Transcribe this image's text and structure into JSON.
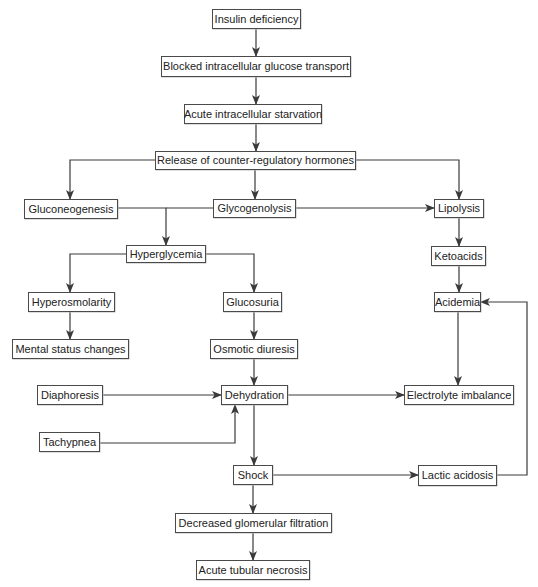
{
  "diagram": {
    "type": "flowchart",
    "colors": {
      "line": "#3a3a3a",
      "box_border": "#4a4a4a",
      "text": "#222222",
      "background": "#ffffff"
    },
    "nodes": [
      {
        "id": "insulin_deficiency",
        "label": "Insulin deficiency",
        "x": 212,
        "y": 9,
        "w": 89,
        "h": 20
      },
      {
        "id": "blocked_transport",
        "label": "Blocked intracellular glucose transport",
        "x": 161,
        "y": 56,
        "w": 190,
        "h": 21
      },
      {
        "id": "acute_starvation",
        "label": "Acute intracellular starvation",
        "x": 184,
        "y": 104,
        "w": 138,
        "h": 20
      },
      {
        "id": "counter_regulatory",
        "label": "Release of counter-regulatory hormones",
        "x": 155,
        "y": 151,
        "w": 201,
        "h": 19
      },
      {
        "id": "gluconeogenesis",
        "label": "Gluconeogenesis",
        "x": 24,
        "y": 199,
        "w": 94,
        "h": 20
      },
      {
        "id": "glycogenolysis",
        "label": "Glycogenolysis",
        "x": 213,
        "y": 199,
        "w": 83,
        "h": 19
      },
      {
        "id": "lipolysis",
        "label": "Lipolysis",
        "x": 434,
        "y": 199,
        "w": 50,
        "h": 19
      },
      {
        "id": "hyperglycemia",
        "label": "Hyperglycemia",
        "x": 126,
        "y": 245,
        "w": 80,
        "h": 18
      },
      {
        "id": "ketoacids",
        "label": "Ketoacids",
        "x": 431,
        "y": 246,
        "w": 55,
        "h": 20
      },
      {
        "id": "hyperosmolarity",
        "label": "Hyperosmolarity",
        "x": 28,
        "y": 292,
        "w": 87,
        "h": 20
      },
      {
        "id": "glucosuria",
        "label": "Glucosuria",
        "x": 223,
        "y": 292,
        "w": 59,
        "h": 20
      },
      {
        "id": "acidemia",
        "label": "Acidemia",
        "x": 434,
        "y": 292,
        "w": 47,
        "h": 20
      },
      {
        "id": "mental_status",
        "label": "Mental status changes",
        "x": 12,
        "y": 339,
        "w": 117,
        "h": 20
      },
      {
        "id": "osmotic_diuresis",
        "label": "Osmotic diuresis",
        "x": 210,
        "y": 339,
        "w": 88,
        "h": 20
      },
      {
        "id": "diaphoresis",
        "label": "Diaphoresis",
        "x": 37,
        "y": 385,
        "w": 66,
        "h": 20
      },
      {
        "id": "dehydration",
        "label": "Dehydration",
        "x": 221,
        "y": 385,
        "w": 67,
        "h": 20
      },
      {
        "id": "electrolyte_imbalance",
        "label": "Electrolyte imbalance",
        "x": 404,
        "y": 385,
        "w": 110,
        "h": 20
      },
      {
        "id": "tachypnea",
        "label": "Tachypnea",
        "x": 39,
        "y": 432,
        "w": 61,
        "h": 20
      },
      {
        "id": "shock",
        "label": "Shock",
        "x": 233,
        "y": 465,
        "w": 40,
        "h": 20
      },
      {
        "id": "lactic_acidosis",
        "label": "Lactic acidosis",
        "x": 418,
        "y": 465,
        "w": 79,
        "h": 21
      },
      {
        "id": "decreased_gfr",
        "label": "Decreased glomerular filtration",
        "x": 175,
        "y": 513,
        "w": 157,
        "h": 20
      },
      {
        "id": "acute_tubular_necrosis",
        "label": "Acute tubular necrosis",
        "x": 196,
        "y": 560,
        "w": 114,
        "h": 20
      }
    ],
    "edges": [
      {
        "from": "insulin_deficiency",
        "to": "blocked_transport",
        "points": [
          [
            256,
            29
          ],
          [
            256,
            56
          ]
        ]
      },
      {
        "from": "blocked_transport",
        "to": "acute_starvation",
        "points": [
          [
            256,
            77
          ],
          [
            256,
            104
          ]
        ]
      },
      {
        "from": "acute_starvation",
        "to": "counter_regulatory",
        "points": [
          [
            256,
            124
          ],
          [
            256,
            151
          ]
        ]
      },
      {
        "from": "counter_regulatory",
        "to": "gluconeogenesis",
        "points": [
          [
            155,
            160
          ],
          [
            70,
            160
          ],
          [
            70,
            199
          ]
        ]
      },
      {
        "from": "counter_regulatory",
        "to": "glycogenolysis",
        "points": [
          [
            255,
            170
          ],
          [
            255,
            199
          ]
        ]
      },
      {
        "from": "counter_regulatory",
        "to": "lipolysis",
        "points": [
          [
            356,
            160
          ],
          [
            459,
            160
          ],
          [
            459,
            199
          ]
        ]
      },
      {
        "from": "gluconeogenesis",
        "to": "hyperglycemia",
        "points": [
          [
            118,
            208
          ],
          [
            166,
            208
          ],
          [
            166,
            245
          ]
        ]
      },
      {
        "from": "glycogenolysis",
        "to": "hyperglycemia",
        "points": [
          [
            213,
            208
          ],
          [
            166,
            208
          ]
        ],
        "arrow": false
      },
      {
        "from": "glycogenolysis",
        "to": "lipolysis",
        "points": [
          [
            296,
            208
          ],
          [
            434,
            208
          ]
        ]
      },
      {
        "from": "lipolysis",
        "to": "ketoacids",
        "points": [
          [
            459,
            218
          ],
          [
            459,
            246
          ]
        ]
      },
      {
        "from": "hyperglycemia",
        "to": "hyperosmolarity",
        "points": [
          [
            126,
            254
          ],
          [
            70,
            254
          ],
          [
            70,
            292
          ]
        ]
      },
      {
        "from": "hyperglycemia",
        "to": "glucosuria",
        "points": [
          [
            206,
            254
          ],
          [
            254,
            254
          ],
          [
            254,
            292
          ]
        ]
      },
      {
        "from": "ketoacids",
        "to": "acidemia",
        "points": [
          [
            459,
            266
          ],
          [
            459,
            292
          ]
        ]
      },
      {
        "from": "hyperosmolarity",
        "to": "mental_status",
        "points": [
          [
            70,
            312
          ],
          [
            70,
            339
          ]
        ]
      },
      {
        "from": "glucosuria",
        "to": "osmotic_diuresis",
        "points": [
          [
            254,
            312
          ],
          [
            254,
            339
          ]
        ]
      },
      {
        "from": "osmotic_diuresis",
        "to": "dehydration",
        "points": [
          [
            254,
            359
          ],
          [
            254,
            385
          ]
        ]
      },
      {
        "from": "acidemia",
        "to": "electrolyte_imbalance",
        "points": [
          [
            458,
            312
          ],
          [
            458,
            385
          ]
        ]
      },
      {
        "from": "diaphoresis",
        "to": "dehydration",
        "points": [
          [
            103,
            395
          ],
          [
            221,
            395
          ]
        ]
      },
      {
        "from": "dehydration",
        "to": "electrolyte_imbalance",
        "points": [
          [
            288,
            395
          ],
          [
            404,
            395
          ]
        ]
      },
      {
        "from": "tachypnea",
        "to": "dehydration",
        "points": [
          [
            100,
            443
          ],
          [
            235,
            443
          ],
          [
            235,
            405
          ]
        ]
      },
      {
        "from": "dehydration",
        "to": "shock",
        "points": [
          [
            254,
            405
          ],
          [
            254,
            465
          ]
        ]
      },
      {
        "from": "shock",
        "to": "lactic_acidosis",
        "points": [
          [
            273,
            475
          ],
          [
            418,
            475
          ]
        ]
      },
      {
        "from": "lactic_acidosis",
        "to": "acidemia",
        "points": [
          [
            497,
            475
          ],
          [
            527,
            475
          ],
          [
            527,
            302
          ],
          [
            481,
            302
          ]
        ]
      },
      {
        "from": "shock",
        "to": "decreased_gfr",
        "points": [
          [
            253,
            485
          ],
          [
            253,
            513
          ]
        ]
      },
      {
        "from": "decreased_gfr",
        "to": "acute_tubular_necrosis",
        "points": [
          [
            253,
            533
          ],
          [
            253,
            560
          ]
        ]
      }
    ]
  }
}
